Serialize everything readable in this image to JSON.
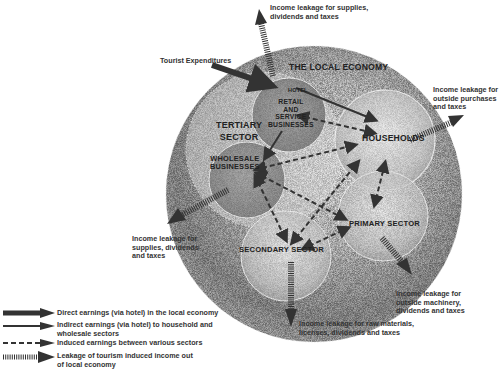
{
  "diagram": {
    "title": "THE LOCAL ECONOMY",
    "entry_label": "Tourist Expenditures",
    "nodes": {
      "hotel": "HOTEL",
      "retail": [
        "RETAIL",
        "AND",
        "SERVICE",
        "BUSINESSES"
      ],
      "tertiary": [
        "TERTIARY",
        "SECTOR"
      ],
      "wholesale": [
        "WHOLESALE",
        "BUSINESSES"
      ],
      "households": "HOUSEHOLDS",
      "primary": "PRIMARY SECTOR",
      "secondary": "SECONDARY SECTOR"
    },
    "leakages": {
      "top": [
        "Income leakage for supplies,",
        "dividends and taxes"
      ],
      "right": [
        "Income leakage for",
        "outside purchases",
        "and taxes"
      ],
      "left": [
        "Income leakage for",
        "supplies, dividends",
        "and taxes"
      ],
      "bottom_right": [
        "Income leakage for",
        "outside machinery,",
        "dividends and taxes"
      ],
      "bottom": [
        "Income leakage for raw materials,",
        "licenses, dividends and taxes"
      ]
    },
    "colors": {
      "arrow": "#3a3a3a",
      "sphere_dark": "#8a8a8a",
      "sphere_light": "#e8e8e8"
    }
  },
  "legend": [
    {
      "type": "direct",
      "text": "Direct earnings (via hotel) in the local economy"
    },
    {
      "type": "indirect",
      "text": "Indirect earnings (via hotel) to household and wholesale sectors"
    },
    {
      "type": "induced",
      "text": "Induced earnings between various sectors"
    },
    {
      "type": "leakage",
      "text": "Leakage of tourism induced income out of local economy"
    }
  ]
}
